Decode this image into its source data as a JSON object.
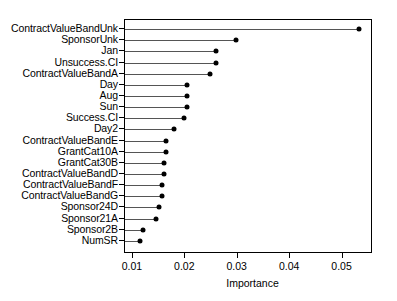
{
  "chart_data": {
    "type": "bar",
    "subtype": "lollipop-dotplot",
    "title": "",
    "xlabel": "Importance",
    "ylabel": "",
    "xlim": [
      0.0085,
      0.0558
    ],
    "xticks": [
      0.01,
      0.02,
      0.03,
      0.04,
      0.05
    ],
    "xticklabels": [
      "0.01",
      "0.02",
      "0.03",
      "0.04",
      "0.05"
    ],
    "grid": false,
    "legend": null,
    "orientation": "horizontal",
    "sorted": "descending",
    "categories": [
      "ContractValueBandUnk",
      "SponsorUnk",
      "Jan",
      "Unsuccess.CI",
      "ContractValueBandA",
      "Day",
      "Aug",
      "Sun",
      "Success.CI",
      "Day2",
      "ContractValueBandE",
      "GrantCat10A",
      "GrantCat30B",
      "ContractValueBandD",
      "ContractValueBandF",
      "ContractValueBandG",
      "Sponsor24D",
      "Sponsor21A",
      "Sponsor2B",
      "NumSR"
    ],
    "values": [
      0.0532,
      0.0296,
      0.0259,
      0.0259,
      0.0248,
      0.0204,
      0.0204,
      0.0204,
      0.0197,
      0.0179,
      0.0164,
      0.0164,
      0.0159,
      0.0159,
      0.0155,
      0.0155,
      0.015,
      0.0145,
      0.0119,
      0.0113
    ]
  }
}
